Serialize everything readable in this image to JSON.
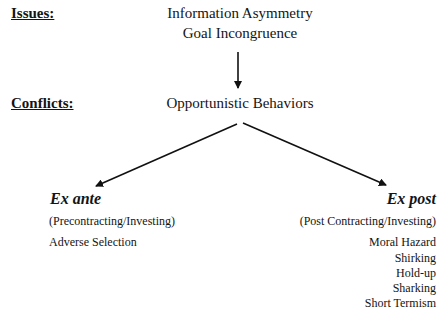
{
  "labels": {
    "issues": "Issues:",
    "conflicts": "Conflicts:"
  },
  "issues": {
    "items": [
      "Information Asymmetry",
      "Goal Incongruence"
    ]
  },
  "conflicts": {
    "center": "Opportunistic Behaviors"
  },
  "branches": {
    "left": {
      "title": "Ex ante",
      "subtitle": "(Precontracting/Investing)",
      "items": [
        "Adverse Selection"
      ]
    },
    "right": {
      "title": "Ex post",
      "subtitle": "(Post Contracting/Investing)",
      "items": [
        "Moral Hazard",
        "Shirking",
        "Hold-up",
        "Sharking",
        "Short Termism"
      ]
    }
  },
  "colors": {
    "text": "#141414",
    "arrow": "#111111",
    "background": "#ffffff"
  }
}
